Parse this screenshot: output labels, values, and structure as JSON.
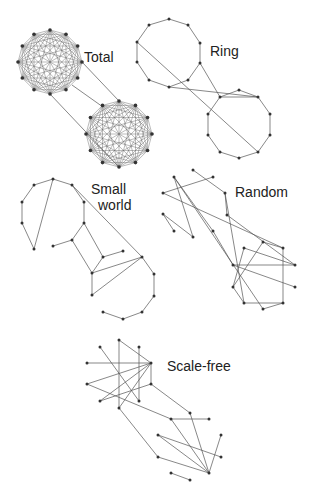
{
  "colors": {
    "edge": "#555555",
    "node": "#333333",
    "text": "#222222",
    "background": "#ffffff"
  },
  "labels": {
    "total": "Total",
    "ring": "Ring",
    "small_world_line1": "Small",
    "small_world_line2": "world",
    "random": "Random",
    "scale_free": "Scale-free"
  },
  "networks": {
    "total": {
      "clusters": [
        {
          "cx": 50,
          "cy": 62,
          "r": 32,
          "n": 12
        },
        {
          "cx": 119,
          "cy": 134,
          "r": 33,
          "n": 12
        }
      ],
      "bridges": [
        [
          [
            72,
            85
          ],
          [
            103,
            107
          ]
        ],
        [
          [
            50,
            94
          ],
          [
            119,
            167
          ]
        ],
        [
          [
            82,
            62
          ],
          [
            119,
            101
          ]
        ]
      ]
    },
    "ring": {
      "nodes": [
        [
          169,
          19
        ],
        [
          188,
          25
        ],
        [
          200,
          43
        ],
        [
          200,
          63
        ],
        [
          188,
          80
        ],
        [
          169,
          87
        ],
        [
          149,
          80
        ],
        [
          137,
          62
        ],
        [
          137,
          42
        ],
        [
          149,
          25
        ],
        [
          239,
          90
        ],
        [
          258,
          97
        ],
        [
          270,
          114
        ],
        [
          270,
          135
        ],
        [
          258,
          152
        ],
        [
          239,
          158
        ],
        [
          220,
          152
        ],
        [
          208,
          135
        ],
        [
          208,
          114
        ],
        [
          220,
          97
        ]
      ],
      "edges": [
        [
          0,
          1
        ],
        [
          1,
          2
        ],
        [
          2,
          3
        ],
        [
          3,
          4
        ],
        [
          4,
          5
        ],
        [
          5,
          6
        ],
        [
          6,
          7
        ],
        [
          7,
          8
        ],
        [
          8,
          9
        ],
        [
          9,
          0
        ],
        [
          10,
          11
        ],
        [
          11,
          12
        ],
        [
          12,
          13
        ],
        [
          13,
          14
        ],
        [
          14,
          15
        ],
        [
          15,
          16
        ],
        [
          16,
          17
        ],
        [
          17,
          18
        ],
        [
          18,
          19
        ],
        [
          19,
          10
        ],
        [
          8,
          14
        ],
        [
          3,
          19
        ],
        [
          5,
          11
        ],
        [
          19,
          11
        ]
      ]
    },
    "small_world": {
      "nodes": [
        [
          53,
          179
        ],
        [
          72,
          185
        ],
        [
          84,
          202
        ],
        [
          84,
          223
        ],
        [
          72,
          240
        ],
        [
          53,
          246
        ],
        [
          34,
          249
        ],
        [
          22,
          223
        ],
        [
          22,
          202
        ],
        [
          34,
          185
        ],
        [
          103,
          257
        ],
        [
          123,
          251
        ],
        [
          142,
          257
        ],
        [
          154,
          274
        ],
        [
          154,
          296
        ],
        [
          142,
          312
        ],
        [
          123,
          319
        ],
        [
          103,
          312
        ],
        [
          92,
          295
        ],
        [
          92,
          273
        ]
      ],
      "edges": [
        [
          0,
          1
        ],
        [
          1,
          2
        ],
        [
          2,
          3
        ],
        [
          3,
          4
        ],
        [
          4,
          5
        ],
        [
          0,
          9
        ],
        [
          9,
          8
        ],
        [
          8,
          7
        ],
        [
          7,
          6
        ],
        [
          0,
          6
        ],
        [
          3,
          10
        ],
        [
          4,
          19
        ],
        [
          10,
          11
        ],
        [
          10,
          19
        ],
        [
          12,
          13
        ],
        [
          13,
          14
        ],
        [
          14,
          15
        ],
        [
          15,
          16
        ],
        [
          16,
          17
        ],
        [
          1,
          12
        ],
        [
          19,
          12
        ],
        [
          18,
          19
        ],
        [
          18,
          12
        ]
      ]
    },
    "random": {
      "nodes": [
        [
          193,
          170
        ],
        [
          213,
          177
        ],
        [
          225,
          193
        ],
        [
          227,
          215
        ],
        [
          213,
          231
        ],
        [
          193,
          237
        ],
        [
          174,
          231
        ],
        [
          163,
          214
        ],
        [
          163,
          193
        ],
        [
          174,
          177
        ],
        [
          263,
          242
        ],
        [
          283,
          248
        ],
        [
          295,
          265
        ],
        [
          295,
          287
        ],
        [
          283,
          303
        ],
        [
          263,
          309
        ],
        [
          244,
          303
        ],
        [
          233,
          287
        ],
        [
          233,
          265
        ],
        [
          244,
          248
        ]
      ],
      "edges": [
        [
          0,
          2
        ],
        [
          1,
          8
        ],
        [
          9,
          4
        ],
        [
          9,
          5
        ],
        [
          9,
          15
        ],
        [
          8,
          11
        ],
        [
          7,
          5
        ],
        [
          6,
          7
        ],
        [
          2,
          16
        ],
        [
          3,
          12
        ],
        [
          4,
          18
        ],
        [
          10,
          17
        ],
        [
          10,
          11
        ],
        [
          11,
          14
        ],
        [
          14,
          16
        ],
        [
          14,
          15
        ],
        [
          18,
          12
        ],
        [
          17,
          19
        ],
        [
          18,
          13
        ],
        [
          19,
          12
        ],
        [
          2,
          3
        ],
        [
          16,
          17
        ]
      ]
    },
    "scale_free": {
      "nodes": [
        [
          119,
          340
        ],
        [
          139,
          347
        ],
        [
          151,
          363
        ],
        [
          151,
          384
        ],
        [
          139,
          401
        ],
        [
          119,
          408
        ],
        [
          100,
          401
        ],
        [
          87,
          384
        ],
        [
          87,
          363
        ],
        [
          100,
          347
        ],
        [
          190,
          413
        ],
        [
          209,
          419
        ],
        [
          221,
          435
        ],
        [
          221,
          457
        ],
        [
          209,
          473
        ],
        [
          190,
          480
        ],
        [
          171,
          473
        ],
        [
          158,
          457
        ],
        [
          158,
          435
        ],
        [
          171,
          419
        ]
      ],
      "edges": [
        [
          0,
          5
        ],
        [
          0,
          2
        ],
        [
          1,
          4
        ],
        [
          8,
          2
        ],
        [
          7,
          2
        ],
        [
          6,
          2
        ],
        [
          9,
          4
        ],
        [
          2,
          5
        ],
        [
          7,
          19
        ],
        [
          3,
          10
        ],
        [
          3,
          2
        ],
        [
          5,
          17
        ],
        [
          10,
          14
        ],
        [
          19,
          11
        ],
        [
          19,
          14
        ],
        [
          18,
          14
        ],
        [
          18,
          13
        ],
        [
          17,
          14
        ],
        [
          12,
          14
        ],
        [
          16,
          15
        ],
        [
          6,
          3
        ]
      ]
    }
  }
}
